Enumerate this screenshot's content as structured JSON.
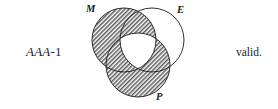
{
  "figure": {
    "type": "venn-diagram",
    "syllogism_form": {
      "mood": "AAA",
      "separator": "-",
      "figure_number": "1",
      "full_text": "AAA-1"
    },
    "verdict": "valid.",
    "background_color": "#ffffff",
    "stroke_color": "#1a1a1a",
    "shade_color": "#808080"
  },
  "circles": [
    {
      "id": "M",
      "label": "M",
      "term": "middle",
      "cx": 42,
      "cy": 40,
      "r": 32,
      "shaded": true
    },
    {
      "id": "E",
      "label": "E",
      "term": "major",
      "cx": 70,
      "cy": 40,
      "r": 32,
      "shaded": false
    },
    {
      "id": "P",
      "label": "P",
      "term": "minor",
      "cx": 56,
      "cy": 65,
      "r": 32,
      "shaded": true
    }
  ],
  "shaded_regions": [
    "M-only",
    "M-and-E-only",
    "M-and-P-only",
    "P-only",
    "P-and-E-only"
  ],
  "unshaded_regions": [
    "E-only",
    "M-and-E-and-P"
  ]
}
